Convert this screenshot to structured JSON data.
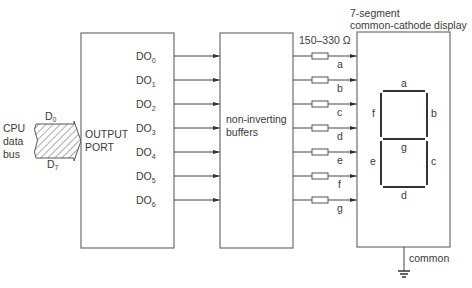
{
  "cpu_bus": {
    "label_lines": [
      "CPU",
      "data",
      "bus"
    ],
    "top_label": "D",
    "top_sub": "0",
    "bottom_label": "D",
    "bottom_sub": "7"
  },
  "output_port": {
    "label_lines": [
      "OUTPUT",
      "PORT"
    ],
    "outputs": [
      {
        "label": "DO",
        "sub": "0"
      },
      {
        "label": "DO",
        "sub": "1"
      },
      {
        "label": "DO",
        "sub": "2"
      },
      {
        "label": "DO",
        "sub": "3"
      },
      {
        "label": "DO",
        "sub": "4"
      },
      {
        "label": "DO",
        "sub": "5"
      },
      {
        "label": "DO",
        "sub": "6"
      }
    ]
  },
  "buffers": {
    "label_lines": [
      "non-inverting",
      "buffers"
    ]
  },
  "resistors": {
    "value_label": "150–330 Ω",
    "line_labels": [
      "a",
      "b",
      "c",
      "d",
      "e",
      "f",
      "g"
    ]
  },
  "display": {
    "title_lines": [
      "7-segment",
      "common-cathode display"
    ],
    "segments": [
      "a",
      "b",
      "c",
      "d",
      "e",
      "f",
      "g"
    ],
    "common_label": "common"
  }
}
